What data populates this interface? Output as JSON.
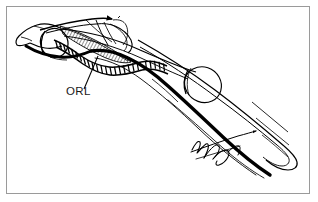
{
  "figure": {
    "domain": "anatomical-line-drawing",
    "background_color": "#ffffff",
    "ink_color": "#000000",
    "frame": {
      "border_color": "#9a9a9a",
      "border_width_px": 1,
      "inset_px": 6,
      "width_px": 304,
      "height_px": 188
    },
    "canvas": {
      "width_px": 318,
      "height_px": 202
    }
  },
  "labels": [
    {
      "id": "orl",
      "text": "ORL",
      "meaning": "oblique retinacular ligament",
      "text_x": 66,
      "text_y": 95,
      "leader_from_x": 84,
      "leader_from_y": 89,
      "leader_to_x": 98,
      "leader_to_y": 56
    }
  ],
  "signature": {
    "present": true,
    "style": "cursive-handwritten",
    "legible": false,
    "position": "lower-right",
    "x": 195,
    "y": 150
  },
  "structures": [
    {
      "name": "distal-phalanx-tuft",
      "description": "distal phalanx with terminal tuft at left tip"
    },
    {
      "name": "distal-interphalangeal-joint",
      "description": "DIP joint condyle outline near left"
    },
    {
      "name": "middle-phalanx",
      "description": "middle phalanx shaft"
    },
    {
      "name": "proximal-interphalangeal-joint",
      "description": "PIP joint condyle, mid-right oval"
    },
    {
      "name": "proximal-phalanx",
      "description": "proximal phalanx shaft extending to lower right"
    },
    {
      "name": "oblique-retinacular-ligament",
      "description": "segmented ladder-like band running obliquely beneath the phalanges"
    },
    {
      "name": "terminal-extensor-tendon",
      "description": "thin tendon strap over dorsum with arrowhead"
    },
    {
      "name": "lateral-band-hatched",
      "description": "cross-hatched triangular lateral band near DIP"
    },
    {
      "name": "flexor-tendon-profile",
      "description": "thick black volar (palmar) contour line"
    },
    {
      "name": "transverse-retinacular-fibers",
      "description": "thin transverse loops over dorsal tendon"
    }
  ]
}
